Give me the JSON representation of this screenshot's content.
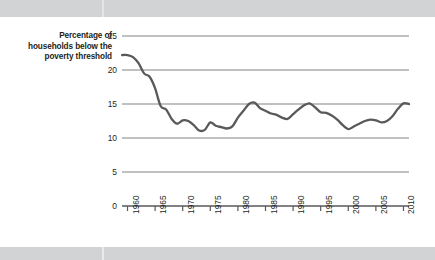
{
  "chart_data": {
    "type": "line",
    "title": "",
    "ylabel": "Percentage of households below the poverty threshold",
    "xlabel": "",
    "ylim": [
      0,
      25
    ],
    "xlim": [
      1959,
      2011
    ],
    "yticks": [
      0,
      5,
      10,
      15,
      20,
      25
    ],
    "ytick_labels": [
      "0",
      "5",
      "10",
      "15",
      "20",
      "25"
    ],
    "xticks": [
      1960,
      1965,
      1970,
      1975,
      1980,
      1985,
      1990,
      1995,
      2000,
      2005,
      2010
    ],
    "xtick_labels": [
      "1960",
      "1965",
      "1970",
      "1975",
      "1980",
      "1985",
      "1990",
      "1995",
      "2000",
      "2005",
      "2010"
    ],
    "grid": "horizontal",
    "legend": "none",
    "series": [
      {
        "name": "Percentage of households below the poverty threshold",
        "color": "#58595b",
        "x": [
          1959,
          1960,
          1961,
          1962,
          1963,
          1964,
          1965,
          1966,
          1967,
          1968,
          1969,
          1970,
          1971,
          1972,
          1973,
          1974,
          1975,
          1976,
          1977,
          1978,
          1979,
          1980,
          1981,
          1982,
          1983,
          1984,
          1985,
          1986,
          1987,
          1988,
          1989,
          1990,
          1991,
          1992,
          1993,
          1994,
          1995,
          1996,
          1997,
          1998,
          1999,
          2000,
          2001,
          2002,
          2003,
          2004,
          2005,
          2006,
          2007,
          2008,
          2009,
          2010,
          2011
        ],
        "values": [
          22.2,
          22.2,
          21.9,
          21.0,
          19.5,
          19.0,
          17.3,
          14.7,
          14.2,
          12.8,
          12.1,
          12.6,
          12.5,
          11.9,
          11.1,
          11.2,
          12.3,
          11.8,
          11.6,
          11.4,
          11.7,
          13.0,
          14.0,
          15.0,
          15.2,
          14.4,
          14.0,
          13.6,
          13.4,
          13.0,
          12.8,
          13.5,
          14.2,
          14.8,
          15.1,
          14.5,
          13.8,
          13.7,
          13.3,
          12.7,
          11.9,
          11.3,
          11.7,
          12.1,
          12.5,
          12.7,
          12.6,
          12.3,
          12.5,
          13.2,
          14.3,
          15.1,
          15.0
        ]
      }
    ]
  },
  "labels": {
    "y_axis_title": "Percentage of households below the poverty threshold"
  }
}
